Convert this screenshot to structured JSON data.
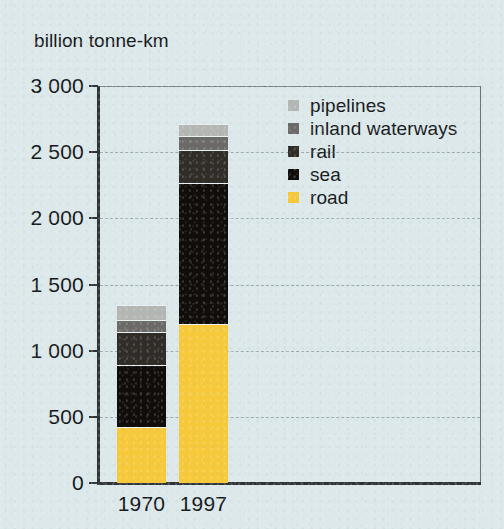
{
  "chart_data": {
    "type": "bar",
    "subtype": "stacked-vertical",
    "title": "",
    "ylabel": "billion tonne-km",
    "xlabel": "",
    "categories": [
      "1970",
      "1997"
    ],
    "ylim": [
      0,
      3000
    ],
    "ytick_values": [
      0,
      500,
      1000,
      1500,
      2000,
      2500,
      3000
    ],
    "ytick_labels": [
      "0",
      "500",
      "1 000",
      "1 500",
      "2 000",
      "2 500",
      "3 000"
    ],
    "grid": true,
    "grid_axis": "y",
    "grid_style": "dashed",
    "legend_position": "upper-right-inside",
    "stack_order_bottom_to_top": [
      "road",
      "sea",
      "rail",
      "inland waterways",
      "pipelines"
    ],
    "series": [
      {
        "name": "road",
        "color": "#f6c93b",
        "values": [
          425,
          1205
        ]
      },
      {
        "name": "sea",
        "color": "#100d0a",
        "values": [
          465,
          1065
        ]
      },
      {
        "name": "rail",
        "color": "#302c28",
        "values": [
          250,
          250
        ]
      },
      {
        "name": "inland waterways",
        "color": "#6b6a68",
        "values": [
          95,
          105
        ]
      },
      {
        "name": "pipelines",
        "color": "#b4b6b4",
        "values": [
          110,
          90
        ]
      }
    ],
    "totals": [
      1345,
      2715
    ],
    "background_color": "#dce8ea",
    "axis_color": "#2f3336",
    "text_color": "#141618"
  },
  "axis": {
    "y_title": "billion tonne-km",
    "ticks": [
      {
        "label": "3 000",
        "value": 3000
      },
      {
        "label": "2 500",
        "value": 2500
      },
      {
        "label": "2 000",
        "value": 2000
      },
      {
        "label": "1 500",
        "value": 1500
      },
      {
        "label": "1 000",
        "value": 1000
      },
      {
        "label": "500",
        "value": 500
      },
      {
        "label": "0",
        "value": 0
      }
    ],
    "categories": [
      {
        "label": "1970"
      },
      {
        "label": "1997"
      }
    ]
  },
  "legend": {
    "items": [
      {
        "label": "pipelines",
        "color": "#b4b6b4"
      },
      {
        "label": "inland waterways",
        "color": "#6b6a68"
      },
      {
        "label": "rail",
        "color": "#302c28"
      },
      {
        "label": "sea",
        "color": "#100d0a"
      },
      {
        "label": "road",
        "color": "#f6c93b"
      }
    ]
  }
}
